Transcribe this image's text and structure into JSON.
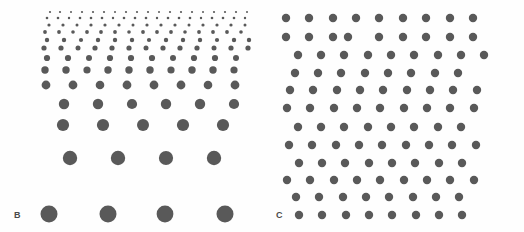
{
  "figure": {
    "title": "",
    "background_color": "#fefefe",
    "dot_color": "#595959",
    "label_color": "#4a4a4a",
    "width": 524,
    "height": 232
  },
  "panels": [
    {
      "id": "panel-b",
      "label": "B",
      "label_x": 14,
      "label_y": 211,
      "description": "texture density gradient of dots, dots shrink and crowd toward the top",
      "dot_color": "#595959"
    },
    {
      "id": "panel-c",
      "label": "C",
      "label_x": 276,
      "label_y": 211,
      "description": "uniform jittered grid of equal-size dots",
      "dot_color": "#595959"
    }
  ],
  "chart_data": {
    "type": "scatter",
    "title": "",
    "xlabel": "",
    "ylabel": "",
    "grid": false,
    "legend": null,
    "xlim": [
      0,
      524
    ],
    "ylim": [
      0,
      232
    ],
    "series": [
      {
        "name": "B",
        "marker": "circle",
        "color": "#595959",
        "points": [
          [
            50,
            12,
            1.1
          ],
          [
            60,
            12,
            1.1
          ],
          [
            71,
            12,
            1.0
          ],
          [
            82,
            12,
            1.1
          ],
          [
            93,
            12,
            1.1
          ],
          [
            104,
            12,
            1.1
          ],
          [
            115,
            12,
            1.0
          ],
          [
            126,
            12,
            1.1
          ],
          [
            137,
            12,
            1.1
          ],
          [
            148,
            12,
            1.1
          ],
          [
            159,
            12,
            1.0
          ],
          [
            170,
            12,
            1.1
          ],
          [
            181,
            12,
            1.1
          ],
          [
            192,
            12,
            1.1
          ],
          [
            203,
            12,
            1.0
          ],
          [
            214,
            12,
            1.1
          ],
          [
            225,
            12,
            1.1
          ],
          [
            236,
            12,
            1.1
          ],
          [
            247,
            12,
            1.0
          ],
          [
            47,
            18,
            1.3
          ],
          [
            58,
            18,
            1.3
          ],
          [
            69,
            18,
            1.2
          ],
          [
            80,
            18,
            1.3
          ],
          [
            91,
            18,
            1.3
          ],
          [
            102,
            18,
            1.3
          ],
          [
            113,
            18,
            1.2
          ],
          [
            124,
            18,
            1.3
          ],
          [
            135,
            18,
            1.3
          ],
          [
            146,
            18,
            1.3
          ],
          [
            157,
            18,
            1.2
          ],
          [
            168,
            18,
            1.3
          ],
          [
            179,
            18,
            1.3
          ],
          [
            190,
            18,
            1.3
          ],
          [
            201,
            18,
            1.2
          ],
          [
            212,
            18,
            1.3
          ],
          [
            223,
            18,
            1.3
          ],
          [
            234,
            18,
            1.3
          ],
          [
            245,
            18,
            1.2
          ],
          [
            49,
            25,
            1.6
          ],
          [
            63,
            25,
            1.6
          ],
          [
            77,
            25,
            1.5
          ],
          [
            91,
            25,
            1.6
          ],
          [
            105,
            25,
            1.6
          ],
          [
            119,
            25,
            1.6
          ],
          [
            133,
            25,
            1.5
          ],
          [
            147,
            25,
            1.6
          ],
          [
            161,
            25,
            1.6
          ],
          [
            175,
            25,
            1.6
          ],
          [
            189,
            25,
            1.5
          ],
          [
            203,
            25,
            1.6
          ],
          [
            217,
            25,
            1.6
          ],
          [
            231,
            25,
            1.6
          ],
          [
            245,
            25,
            1.5
          ],
          [
            45,
            32,
            1.9
          ],
          [
            59,
            32,
            1.9
          ],
          [
            73,
            32,
            1.8
          ],
          [
            87,
            32,
            1.9
          ],
          [
            101,
            32,
            1.9
          ],
          [
            115,
            32,
            1.9
          ],
          [
            129,
            32,
            1.8
          ],
          [
            143,
            32,
            1.9
          ],
          [
            157,
            32,
            1.9
          ],
          [
            171,
            32,
            1.9
          ],
          [
            185,
            32,
            1.8
          ],
          [
            199,
            32,
            1.9
          ],
          [
            213,
            32,
            1.9
          ],
          [
            227,
            32,
            1.9
          ],
          [
            241,
            32,
            1.8
          ],
          [
            47,
            40,
            2.2
          ],
          [
            64,
            40,
            2.2
          ],
          [
            81,
            40,
            2.1
          ],
          [
            98,
            40,
            2.2
          ],
          [
            115,
            40,
            2.2
          ],
          [
            132,
            40,
            2.2
          ],
          [
            149,
            40,
            2.1
          ],
          [
            166,
            40,
            2.2
          ],
          [
            183,
            40,
            2.2
          ],
          [
            200,
            40,
            2.2
          ],
          [
            217,
            40,
            2.1
          ],
          [
            234,
            40,
            2.2
          ],
          [
            249,
            40,
            2.2
          ],
          [
            44,
            48,
            2.6
          ],
          [
            61,
            48,
            2.6
          ],
          [
            78,
            48,
            2.5
          ],
          [
            95,
            48,
            2.6
          ],
          [
            112,
            48,
            2.6
          ],
          [
            129,
            48,
            2.6
          ],
          [
            146,
            48,
            2.5
          ],
          [
            163,
            48,
            2.6
          ],
          [
            180,
            48,
            2.6
          ],
          [
            197,
            48,
            2.6
          ],
          [
            214,
            48,
            2.5
          ],
          [
            231,
            48,
            2.6
          ],
          [
            248,
            48,
            2.6
          ],
          [
            47,
            58,
            3.1
          ],
          [
            68,
            58,
            3.1
          ],
          [
            89,
            58,
            3.0
          ],
          [
            110,
            58,
            3.1
          ],
          [
            131,
            58,
            3.1
          ],
          [
            152,
            58,
            3.1
          ],
          [
            173,
            58,
            3.0
          ],
          [
            194,
            58,
            3.1
          ],
          [
            215,
            58,
            3.1
          ],
          [
            236,
            58,
            3.0
          ],
          [
            45,
            70,
            3.7
          ],
          [
            66,
            70,
            3.7
          ],
          [
            87,
            70,
            3.6
          ],
          [
            108,
            70,
            3.7
          ],
          [
            129,
            70,
            3.7
          ],
          [
            150,
            70,
            3.7
          ],
          [
            171,
            70,
            3.6
          ],
          [
            192,
            70,
            3.7
          ],
          [
            213,
            70,
            3.7
          ],
          [
            234,
            70,
            3.6
          ],
          [
            46,
            85,
            4.4
          ],
          [
            73,
            85,
            4.4
          ],
          [
            100,
            85,
            4.3
          ],
          [
            127,
            85,
            4.4
          ],
          [
            154,
            85,
            4.4
          ],
          [
            181,
            85,
            4.4
          ],
          [
            208,
            85,
            4.3
          ],
          [
            235,
            85,
            4.4
          ],
          [
            64,
            104,
            5.2
          ],
          [
            98,
            104,
            5.2
          ],
          [
            132,
            104,
            5.1
          ],
          [
            166,
            104,
            5.2
          ],
          [
            200,
            104,
            5.2
          ],
          [
            234,
            104,
            5.1
          ],
          [
            63,
            125,
            6.1
          ],
          [
            103,
            125,
            6.1
          ],
          [
            143,
            125,
            6.0
          ],
          [
            183,
            125,
            6.1
          ],
          [
            223,
            125,
            6.1
          ],
          [
            70,
            158,
            7.2
          ],
          [
            118,
            158,
            7.2
          ],
          [
            166,
            158,
            7.1
          ],
          [
            214,
            158,
            7.2
          ],
          [
            49,
            214,
            8.5
          ],
          [
            108,
            214,
            8.5
          ],
          [
            165,
            214,
            8.4
          ],
          [
            225,
            214,
            8.5
          ]
        ]
      },
      {
        "name": "C",
        "marker": "circle",
        "color": "#595959",
        "points": [
          [
            286,
            18,
            4.2
          ],
          [
            309,
            18,
            4.2
          ],
          [
            333,
            18,
            4.2
          ],
          [
            356,
            18,
            4.2
          ],
          [
            379,
            18,
            4.2
          ],
          [
            403,
            18,
            4.2
          ],
          [
            426,
            18,
            4.2
          ],
          [
            450,
            18,
            4.2
          ],
          [
            473,
            18,
            4.2
          ],
          [
            286,
            37,
            4.2
          ],
          [
            309,
            37,
            4.2
          ],
          [
            333,
            37,
            4.2
          ],
          [
            348,
            37,
            4.2
          ],
          [
            379,
            37,
            4.2
          ],
          [
            403,
            37,
            4.2
          ],
          [
            426,
            37,
            4.2
          ],
          [
            450,
            37,
            4.2
          ],
          [
            473,
            37,
            4.2
          ],
          [
            298,
            55,
            4.2
          ],
          [
            321,
            55,
            4.2
          ],
          [
            344,
            55,
            4.2
          ],
          [
            368,
            55,
            4.2
          ],
          [
            391,
            55,
            4.2
          ],
          [
            414,
            55,
            4.2
          ],
          [
            438,
            55,
            4.2
          ],
          [
            461,
            55,
            4.2
          ],
          [
            484,
            55,
            4.2
          ],
          [
            295,
            73,
            4.2
          ],
          [
            318,
            73,
            4.2
          ],
          [
            341,
            73,
            4.2
          ],
          [
            365,
            73,
            4.2
          ],
          [
            388,
            73,
            4.2
          ],
          [
            411,
            73,
            4.2
          ],
          [
            435,
            73,
            4.2
          ],
          [
            458,
            73,
            4.2
          ],
          [
            290,
            90,
            4.2
          ],
          [
            313,
            90,
            4.2
          ],
          [
            337,
            90,
            4.2
          ],
          [
            360,
            90,
            4.2
          ],
          [
            383,
            90,
            4.2
          ],
          [
            407,
            90,
            4.2
          ],
          [
            430,
            90,
            4.2
          ],
          [
            453,
            90,
            4.2
          ],
          [
            477,
            90,
            4.2
          ],
          [
            287,
            108,
            4.2
          ],
          [
            310,
            108,
            4.2
          ],
          [
            334,
            108,
            4.2
          ],
          [
            357,
            108,
            4.2
          ],
          [
            380,
            108,
            4.2
          ],
          [
            404,
            108,
            4.2
          ],
          [
            427,
            108,
            4.2
          ],
          [
            450,
            108,
            4.2
          ],
          [
            474,
            108,
            4.2
          ],
          [
            298,
            127,
            4.2
          ],
          [
            321,
            127,
            4.2
          ],
          [
            344,
            127,
            4.2
          ],
          [
            368,
            127,
            4.2
          ],
          [
            391,
            127,
            4.2
          ],
          [
            414,
            127,
            4.2
          ],
          [
            438,
            127,
            4.2
          ],
          [
            461,
            127,
            4.2
          ],
          [
            289,
            145,
            4.2
          ],
          [
            312,
            145,
            4.2
          ],
          [
            336,
            145,
            4.2
          ],
          [
            359,
            145,
            4.2
          ],
          [
            382,
            145,
            4.2
          ],
          [
            406,
            145,
            4.2
          ],
          [
            429,
            145,
            4.2
          ],
          [
            452,
            145,
            4.2
          ],
          [
            476,
            145,
            4.2
          ],
          [
            299,
            163,
            4.2
          ],
          [
            322,
            163,
            4.2
          ],
          [
            345,
            163,
            4.2
          ],
          [
            369,
            163,
            4.2
          ],
          [
            392,
            163,
            4.2
          ],
          [
            415,
            163,
            4.2
          ],
          [
            439,
            163,
            4.2
          ],
          [
            462,
            163,
            4.2
          ],
          [
            287,
            180,
            4.2
          ],
          [
            310,
            180,
            4.2
          ],
          [
            334,
            180,
            4.2
          ],
          [
            357,
            180,
            4.2
          ],
          [
            380,
            180,
            4.2
          ],
          [
            404,
            180,
            4.2
          ],
          [
            427,
            180,
            4.2
          ],
          [
            450,
            180,
            4.2
          ],
          [
            474,
            180,
            4.2
          ],
          [
            296,
            197,
            4.2
          ],
          [
            319,
            197,
            4.2
          ],
          [
            343,
            197,
            4.2
          ],
          [
            366,
            197,
            4.2
          ],
          [
            389,
            197,
            4.2
          ],
          [
            413,
            197,
            4.2
          ],
          [
            436,
            197,
            4.2
          ],
          [
            459,
            197,
            4.2
          ],
          [
            299,
            215,
            4.2
          ],
          [
            322,
            215,
            4.2
          ],
          [
            346,
            215,
            4.2
          ],
          [
            369,
            215,
            4.2
          ],
          [
            392,
            215,
            4.2
          ],
          [
            416,
            215,
            4.2
          ],
          [
            439,
            215,
            4.2
          ],
          [
            462,
            215,
            4.2
          ]
        ]
      }
    ]
  }
}
